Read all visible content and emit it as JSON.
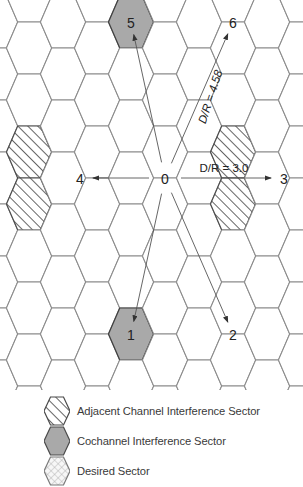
{
  "diagram": {
    "center_cell": {
      "label": "0",
      "type": "desired"
    },
    "cochannel_cells": [
      {
        "label": "1",
        "type": "cochannel"
      },
      {
        "label": "2",
        "type": "cochannel"
      },
      {
        "label": "3",
        "type": "cochannel"
      },
      {
        "label": "4",
        "type": "cochannel"
      },
      {
        "label": "5",
        "type": "cochannel"
      },
      {
        "label": "6",
        "type": "cochannel"
      }
    ],
    "annotations": [
      {
        "name": "dr-ratio-horizontal",
        "text": "D/R = 3.0",
        "rotation": 0
      },
      {
        "name": "dr-ratio-diagonal",
        "text": "D/R = 4.58",
        "rotation": -72
      }
    ]
  },
  "legend": {
    "items": [
      {
        "swatch": "hatched-hexagon-icon",
        "label": "Adjacent Channel Interference Sector"
      },
      {
        "swatch": "solid-gray-hexagon-icon",
        "label": "Cochannel Interference Sector"
      },
      {
        "swatch": "crosshatch-hexagon-icon",
        "label": "Desired Sector"
      }
    ]
  },
  "colors": {
    "cochannel_fill": "#a9a9a9",
    "desired_fill": "#f0f0f0",
    "hatch_stroke": "#4a4a4a",
    "cell_stroke": "#8a8a8a",
    "text": "#222222",
    "leader_line": "#555555"
  },
  "chart_data": {
    "type": "diagram",
    "grid": {
      "hex_orientation": "pointy-left-right",
      "hex_width": 45,
      "hex_height": 52,
      "column_step": 34,
      "row_step": 26,
      "columns": 9,
      "rows": 16
    },
    "cells": [
      {
        "label": "0",
        "type": "desired",
        "cx": 165,
        "cy": 178
      },
      {
        "label": "5",
        "type": "cochannel",
        "cx": 131,
        "cy": 22
      },
      {
        "label": "6",
        "type": "cochannel",
        "cx": 233,
        "cy": 22
      },
      {
        "label": "4",
        "type": "cochannel",
        "cx": 80,
        "cy": 178
      },
      {
        "label": "3",
        "type": "cochannel",
        "cx": 284,
        "cy": 178
      },
      {
        "label": "1",
        "type": "cochannel",
        "cx": 131,
        "cy": 334
      },
      {
        "label": "2",
        "type": "cochannel",
        "cx": 233,
        "cy": 334
      }
    ],
    "adjacent_cells": [
      {
        "cx": 80,
        "cy": 48
      },
      {
        "cx": 182,
        "cy": 48
      },
      {
        "cx": 284,
        "cy": 48
      },
      {
        "cx": 29,
        "cy": 152
      },
      {
        "cx": 131,
        "cy": 152
      },
      {
        "cx": 233,
        "cy": 152
      },
      {
        "cx": 29,
        "cy": 204
      },
      {
        "cx": 131,
        "cy": 204
      },
      {
        "cx": 233,
        "cy": 204
      },
      {
        "cx": 80,
        "cy": 308
      },
      {
        "cx": 182,
        "cy": 308
      },
      {
        "cx": 284,
        "cy": 308
      },
      {
        "cx": 80,
        "cy": 360
      },
      {
        "cx": 182,
        "cy": 360
      }
    ],
    "leaders": [
      {
        "from": [
          165,
          178
        ],
        "to": [
          131,
          22
        ],
        "label": null
      },
      {
        "from": [
          165,
          178
        ],
        "to": [
          233,
          22
        ],
        "label": "D/R = 4.58"
      },
      {
        "from": [
          165,
          178
        ],
        "to": [
          80,
          178
        ],
        "label": null
      },
      {
        "from": [
          165,
          178
        ],
        "to": [
          284,
          178
        ],
        "label": "D/R = 3.0"
      },
      {
        "from": [
          165,
          178
        ],
        "to": [
          131,
          334
        ],
        "label": null
      },
      {
        "from": [
          165,
          178
        ],
        "to": [
          233,
          334
        ],
        "label": null
      }
    ]
  }
}
